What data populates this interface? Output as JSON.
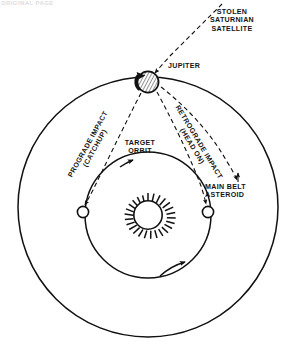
{
  "figure": {
    "type": "orbital-mechanics-diagram",
    "background_color": "#ffffff",
    "ink_color": "#111111",
    "remnant_text": "ORIGINAL PAGE"
  },
  "labels": {
    "stolen_satellite": "STOLEN\nSATURNIAN\nSATELLITE",
    "jupiter": "JUPITER",
    "prograde": "PROGRADE IMPACT\n(CATCHUP)",
    "retrograde": "RETROGRADE IMPACT\n(HEAD ON)",
    "target_orbit": "TARGET\nORBIT",
    "main_belt_asteroid": "MAIN BELT\nASTEROID"
  },
  "bodies": {
    "sun": {
      "name": "sun",
      "cx": 148,
      "cy": 215,
      "r": 13,
      "style": "sunburst"
    },
    "jupiter": {
      "name": "jupiter",
      "cx": 148,
      "cy": 82,
      "r": 11,
      "style": "hatched-disk"
    },
    "target_left": {
      "name": "target-body-left",
      "cx": 83,
      "cy": 212,
      "r": 5.6,
      "style": "open-circle"
    },
    "target_right": {
      "name": "target-body-right",
      "cx": 208,
      "cy": 212,
      "r": 5.6,
      "style": "open-circle"
    }
  },
  "orbits": {
    "main_belt": {
      "name": "main-belt-orbit",
      "cx": 148,
      "cy": 207,
      "r": 130,
      "style": "solid"
    },
    "target": {
      "name": "target-orbit",
      "cx": 148,
      "cy": 215,
      "r": 63,
      "style": "solid",
      "direction": "clockwise"
    }
  },
  "trajectories": [
    {
      "name": "incoming-saturnian-satellite",
      "style": "dashed",
      "terminates_at": "jupiter"
    },
    {
      "name": "prograde-impact-path",
      "style": "dashed",
      "terminates_at": "target-body-left"
    },
    {
      "name": "retrograde-impact-path",
      "style": "dashed",
      "terminates_at": "target-body-right"
    },
    {
      "name": "main-belt-ejection-path",
      "style": "dashed",
      "terminates_at": "main-belt-orbit"
    }
  ]
}
